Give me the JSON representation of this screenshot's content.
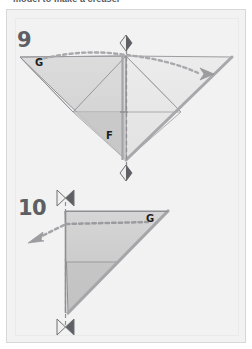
{
  "document": {
    "caption_above": "model to make a creaser"
  },
  "panel": {
    "background_color": "#f2f2f2",
    "border_color": "#d8d8d8"
  },
  "steps": [
    {
      "number": "9",
      "labels": [
        {
          "text": "G",
          "role": "corner-reference-left"
        },
        {
          "text": "F",
          "role": "corner-reference-center"
        }
      ],
      "markers": [
        {
          "type": "diamond-marker",
          "position": "top-center",
          "meaning": "fold-alignment-point"
        },
        {
          "type": "diamond-marker",
          "position": "bottom-center",
          "meaning": "fold-alignment-point"
        }
      ],
      "arrows": [
        {
          "type": "dotted-arrow",
          "direction": "right",
          "meaning": "fold-right-flap-over"
        }
      ],
      "fold_lines": [
        {
          "type": "dashed-vertical",
          "meaning": "valley-fold-centerline"
        },
        {
          "type": "dotted-curve",
          "meaning": "fold-path-guide"
        }
      ],
      "shape": "wide downward-pointing double triangle (bird base spread)"
    },
    {
      "number": "10",
      "labels": [
        {
          "text": "G",
          "role": "corner-reference-right"
        }
      ],
      "markers": [
        {
          "type": "bowtie-marker",
          "position": "top",
          "meaning": "equal-distance-indicator"
        },
        {
          "type": "bowtie-marker",
          "position": "bottom",
          "meaning": "equal-distance-indicator"
        }
      ],
      "arrows": [
        {
          "type": "dotted-arrow",
          "direction": "left",
          "meaning": "unfold-flap-to-left"
        }
      ],
      "fold_lines": [
        {
          "type": "dashed-vertical",
          "meaning": "reference-centerline"
        },
        {
          "type": "dotted-horizontal",
          "meaning": "fold-path-guide"
        }
      ],
      "shape": "right triangle with vertical left edge and hypotenuse to lower-left"
    }
  ],
  "palette": {
    "paper_light": "#e3e3e3",
    "paper_mid": "#d2d2d2",
    "paper_dark": "#c4c4c4",
    "edge_stroke": "#8e8e92",
    "edge_stroke_dark": "#9a9a9e",
    "guide_dotted": "#a9a9ad",
    "marker_fill": "#e8e8e8",
    "marker_stroke": "#6f7074",
    "text_dark": "#1d1d1f",
    "number_gray": "#5d5f63"
  }
}
